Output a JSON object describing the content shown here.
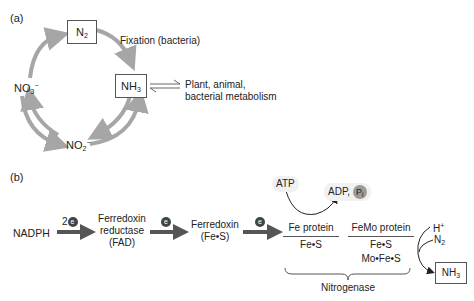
{
  "panel_a": {
    "label": "(a)",
    "nodes": {
      "n2": {
        "main": "N",
        "sub": "2"
      },
      "nh3": {
        "main": "NH",
        "sub": "3"
      },
      "no3": {
        "main": "NO",
        "sub": "3",
        "sup": "−"
      },
      "no2": {
        "main": "NO",
        "sub": "2",
        "sup": "−"
      }
    },
    "fixation_label": "Fixation (bacteria)",
    "metabolism_label_line1": "Plant, animal,",
    "metabolism_label_line2": "bacterial metabolism",
    "arrow_color": "#a6a6a6"
  },
  "panel_b": {
    "label": "(b)",
    "nadph": "NADPH",
    "electron_count": "2",
    "electron_symbol": "e",
    "ferredoxin_reductase_line1": "Ferredoxin",
    "ferredoxin_reductase_line2": "reductase",
    "ferredoxin_reductase_line3": "(FAD)",
    "ferredoxin_line1": "Ferredoxin",
    "ferredoxin_line2": "(Fe•S)",
    "fe_protein": "Fe protein",
    "fe_protein_cofactor": "Fe•S",
    "femo_protein": "FeMo protein",
    "femo_cofactor1": "Fe•S",
    "femo_cofactor2": "Mo•Fe•S",
    "nitrogenase": "Nitrogenase",
    "atp": "ATP",
    "adp": "ADP",
    "comma": ",",
    "pi_main": "P",
    "pi_sub": "i",
    "h_plus": "H",
    "h_plus_sup": "+",
    "n2": {
      "main": "N",
      "sub": "2"
    },
    "nh3": {
      "main": "NH",
      "sub": "3"
    },
    "arrow_color": "#555555"
  }
}
